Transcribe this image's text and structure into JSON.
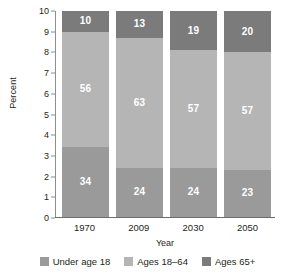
{
  "chart_data": {
    "type": "bar",
    "subtype": "stacked-bar-100",
    "title": "",
    "xlabel": "Year",
    "ylabel": "Percent",
    "categories": [
      "1970",
      "2009",
      "2030",
      "2050"
    ],
    "ylim": [
      0,
      10
    ],
    "yticks": [
      "0",
      "1",
      "2",
      "3",
      "4",
      "5",
      "6",
      "7",
      "8",
      "9",
      "10"
    ],
    "grid": false,
    "legend_position": "bottom",
    "series": [
      {
        "name": "Under age 18",
        "color": "#9a9a9a",
        "values": [
          34,
          24,
          24,
          23
        ]
      },
      {
        "name": "Ages 18–64",
        "color": "#b5b5b5",
        "values": [
          56,
          63,
          57,
          57
        ]
      },
      {
        "name": "Ages 65+",
        "color": "#7b7b7b",
        "values": [
          10,
          13,
          19,
          20
        ]
      }
    ]
  },
  "axes": {
    "y_title": "Percent",
    "x_title": "Year",
    "y_ticks": [
      "10",
      "9",
      "8",
      "7",
      "6",
      "5",
      "4",
      "3",
      "2",
      "1",
      "0"
    ],
    "x_ticks": [
      "1970",
      "2009",
      "2030",
      "2050"
    ]
  },
  "legend": {
    "items": [
      {
        "label": "Under age 18",
        "color": "#9a9a9a"
      },
      {
        "label": "Ages 18–64",
        "color": "#b5b5b5"
      },
      {
        "label": "Ages 65+",
        "color": "#7b7b7b"
      }
    ]
  },
  "bar_labels": {
    "under18": [
      "34",
      "24",
      "24",
      "23"
    ],
    "ages1864": [
      "56",
      "63",
      "57",
      "57"
    ],
    "ages65": [
      "10",
      "13",
      "19",
      "20"
    ]
  },
  "colors": {
    "under18": "#9a9a9a",
    "ages1864": "#b5b5b5",
    "ages65": "#7b7b7b",
    "axis": "#8e8e8e",
    "text": "#231f20",
    "value_text": "#ffffff"
  }
}
